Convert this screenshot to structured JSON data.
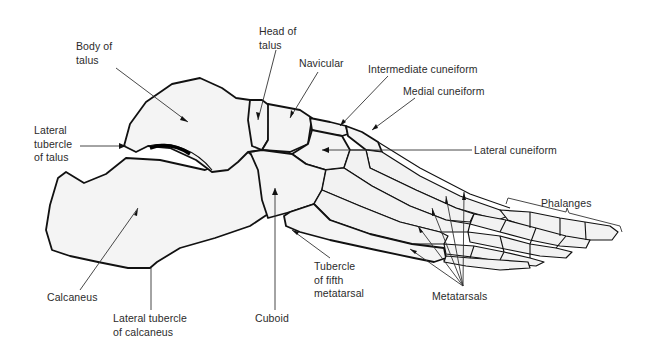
{
  "figure": {
    "background": "#ffffff",
    "ink_color": "#111111",
    "label_color": "#2b2b2b"
  },
  "labels": {
    "body_of_talus": "Body of\ntalus",
    "head_of_talus": "Head of\ntalus",
    "navicular": "Navicular",
    "intermediate_cuneiform": "Intermediate cuneiform",
    "medial_cuneiform": "Medial cuneiform",
    "lateral_tubercle_of_talus": "Lateral\ntubercle\nof talus",
    "lateral_cuneiform": "Lateral cuneiform",
    "phalanges": "Phalanges",
    "calcaneus": "Calcaneus",
    "lateral_tubercle_of_calcaneus": "Lateral tubercle\nof calcaneus",
    "cuboid": "Cuboid",
    "tubercle_of_fifth_metatarsal": "Tubercle\nof fifth\nmetatarsal",
    "metatarsals": "Metatarsals"
  }
}
